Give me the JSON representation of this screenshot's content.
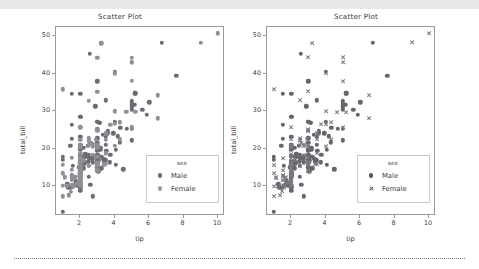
{
  "window": {
    "top_bar_color": "#e9e9e9",
    "background": "#ffffff",
    "separator_color": "#7b7b8d"
  },
  "colors": {
    "male": "#6b6b72",
    "female": "#8f8f96",
    "axis": "#9a9a9a",
    "text": "#3d3d3d",
    "legend_border": "#c9c9c9"
  },
  "panels": [
    {
      "id": "left",
      "title": "Scatter Plot",
      "xlabel": "tip",
      "ylabel": "total_bill",
      "xticks": [
        "2",
        "4",
        "6",
        "8",
        "10"
      ],
      "yticks": [
        "10",
        "20",
        "30",
        "40",
        "50"
      ],
      "legend": {
        "title": "sex",
        "entries": [
          {
            "label": "Male",
            "marker": "circle",
            "color": "#6b6b72"
          },
          {
            "label": "Female",
            "marker": "circle",
            "color": "#9a9aa1"
          }
        ]
      }
    },
    {
      "id": "right",
      "title": "Scatter Plot",
      "xlabel": "tip",
      "ylabel": "total_bill",
      "xticks": [
        "2",
        "4",
        "6",
        "8",
        "10"
      ],
      "yticks": [
        "10",
        "20",
        "30",
        "40",
        "50"
      ],
      "legend": {
        "title": "sex",
        "entries": [
          {
            "label": "Male",
            "marker": "circle",
            "color": "#55555c"
          },
          {
            "label": "Female",
            "marker": "x",
            "color": "#55555c"
          }
        ]
      }
    }
  ],
  "chart_data": {
    "type": "scatter",
    "title": "Scatter Plot",
    "xlabel": "tip",
    "ylabel": "total_bill",
    "xlim": [
      0.6,
      10.4
    ],
    "ylim": [
      2.0,
      52.5
    ],
    "xticks": [
      2,
      4,
      6,
      8,
      10
    ],
    "yticks": [
      10,
      20,
      30,
      40,
      50
    ],
    "grid": false,
    "legend_title": "sex",
    "legend_position": "lower right",
    "panels": [
      {
        "title": "Scatter Plot",
        "style": "hue-only",
        "markers": {
          "Male": "circle",
          "Female": "circle"
        }
      },
      {
        "title": "Scatter Plot",
        "style": "hue-and-style",
        "markers": {
          "Male": "circle",
          "Female": "x"
        }
      }
    ],
    "series": [
      {
        "name": "Male",
        "marker": "circle",
        "color": "#6b6b72",
        "points": [
          [
            1.01,
            16.99
          ],
          [
            1.66,
            10.34
          ],
          [
            3.5,
            21.01
          ],
          [
            3.31,
            23.68
          ],
          [
            3.61,
            24.59
          ],
          [
            4.71,
            25.29
          ],
          [
            2.0,
            8.77
          ],
          [
            3.12,
            26.88
          ],
          [
            1.96,
            15.04
          ],
          [
            3.23,
            14.78
          ],
          [
            1.71,
            10.27
          ],
          [
            1.57,
            15.42
          ],
          [
            3.0,
            21.58
          ],
          [
            3.02,
            16.29
          ],
          [
            3.92,
            24.08
          ],
          [
            1.67,
            10.33
          ],
          [
            3.71,
            16.31
          ],
          [
            3.5,
            16.93
          ],
          [
            3.35,
            17.29
          ],
          [
            4.08,
            19.65
          ],
          [
            2.75,
            17.92
          ],
          [
            2.23,
            20.29
          ],
          [
            7.58,
            39.42
          ],
          [
            3.18,
            19.82
          ],
          [
            2.34,
            17.81
          ],
          [
            2.0,
            13.37
          ],
          [
            2.0,
            12.69
          ],
          [
            4.3,
            21.7
          ],
          [
            3.0,
            19.65
          ],
          [
            1.45,
            9.55
          ],
          [
            2.5,
            18.35
          ],
          [
            3.0,
            15.06
          ],
          [
            2.45,
            20.69
          ],
          [
            3.27,
            17.78
          ],
          [
            3.6,
            24.06
          ],
          [
            2.0,
            16.31
          ],
          [
            3.07,
            16.93
          ],
          [
            2.31,
            18.69
          ],
          [
            5.0,
            31.27
          ],
          [
            2.24,
            16.04
          ],
          [
            2.54,
            17.46
          ],
          [
            3.06,
            13.94
          ],
          [
            1.32,
            9.68
          ],
          [
            5.6,
            30.4
          ],
          [
            3.0,
            18.29
          ],
          [
            5.0,
            22.23
          ],
          [
            6.0,
            32.4
          ],
          [
            2.05,
            28.55
          ],
          [
            3.0,
            18.04
          ],
          [
            2.5,
            12.54
          ],
          [
            2.6,
            10.29
          ],
          [
            5.2,
            34.81
          ],
          [
            1.56,
            9.94
          ],
          [
            4.34,
            25.56
          ],
          [
            3.51,
            19.49
          ],
          [
            3.0,
            38.01
          ],
          [
            1.5,
            26.41
          ],
          [
            1.76,
            11.24
          ],
          [
            6.73,
            48.27
          ],
          [
            3.21,
            20.29
          ],
          [
            2.0,
            13.81
          ],
          [
            1.98,
            11.02
          ],
          [
            3.76,
            18.29
          ],
          [
            2.64,
            17.59
          ],
          [
            3.15,
            20.08
          ],
          [
            2.47,
            16.45
          ],
          [
            1.0,
            3.07
          ],
          [
            2.01,
            20.23
          ],
          [
            2.09,
            15.01
          ],
          [
            1.97,
            12.02
          ],
          [
            3.0,
            17.07
          ],
          [
            3.14,
            26.86
          ],
          [
            5.0,
            25.28
          ],
          [
            2.2,
            14.73
          ],
          [
            1.25,
            10.51
          ],
          [
            3.08,
            17.92
          ],
          [
            4.0,
            27.2
          ],
          [
            3.0,
            22.76
          ],
          [
            2.71,
            17.29
          ],
          [
            3.0,
            19.44
          ],
          [
            3.4,
            16.66
          ],
          [
            1.83,
            10.07
          ],
          [
            5.0,
            32.68
          ],
          [
            2.03,
            15.98
          ],
          [
            5.17,
            34.83
          ],
          [
            5.85,
            29.03
          ],
          [
            3.0,
            27.18
          ],
          [
            1.5,
            22.67
          ],
          [
            1.0,
            17.82
          ],
          [
            2.0,
            12.46
          ],
          [
            2.74,
            16.32
          ],
          [
            2.0,
            16.0
          ],
          [
            2.0,
            10.09
          ],
          [
            5.14,
            31.71
          ],
          [
            5.0,
            31.85
          ],
          [
            2.2,
            16.82
          ],
          [
            3.48,
            32.9
          ],
          [
            2.24,
            17.89
          ],
          [
            4.5,
            14.48
          ],
          [
            2.0,
            9.6
          ],
          [
            2.0,
            34.63
          ],
          [
            1.5,
            34.65
          ],
          [
            4.19,
            23.33
          ],
          [
            2.56,
            45.35
          ],
          [
            2.02,
            23.17
          ],
          [
            4.0,
            40.55
          ],
          [
            1.44,
            20.69
          ],
          [
            2.0,
            20.9
          ],
          [
            5.0,
            30.46
          ],
          [
            2.0,
            18.15
          ],
          [
            3.48,
            23.1
          ],
          [
            4.08,
            15.69
          ],
          [
            2.0,
            19.81
          ],
          [
            2.0,
            28.44
          ],
          [
            2.5,
            15.48
          ],
          [
            3.0,
            16.58
          ],
          [
            2.72,
            7.25
          ],
          [
            2.88,
            31.27
          ],
          [
            2.0,
            13.0
          ],
          [
            3.0,
            18.04
          ]
        ]
      },
      {
        "name": "Female",
        "marker_left": "circle",
        "marker_right": "x",
        "color": "#8f8f96",
        "points": [
          [
            1.0,
            10.07
          ],
          [
            3.02,
            16.29
          ],
          [
            1.67,
            10.33
          ],
          [
            3.0,
            35.26
          ],
          [
            3.39,
            15.77
          ],
          [
            1.64,
            11.87
          ],
          [
            2.0,
            14.83
          ],
          [
            1.97,
            20.29
          ],
          [
            2.0,
            13.42
          ],
          [
            1.5,
            11.69
          ],
          [
            2.5,
            22.76
          ],
          [
            3.0,
            20.29
          ],
          [
            2.0,
            17.31
          ],
          [
            3.5,
            22.42
          ],
          [
            2.0,
            16.49
          ],
          [
            2.01,
            15.36
          ],
          [
            1.0,
            7.25
          ],
          [
            2.75,
            20.53
          ],
          [
            3.0,
            15.95
          ],
          [
            1.5,
            10.33
          ],
          [
            4.3,
            27.05
          ],
          [
            1.45,
            8.52
          ],
          [
            2.0,
            14.0
          ],
          [
            1.56,
            9.78
          ],
          [
            2.0,
            13.03
          ],
          [
            2.75,
            18.28
          ],
          [
            1.1,
            12.16
          ],
          [
            3.0,
            25.21
          ],
          [
            4.3,
            22.49
          ],
          [
            5.0,
            44.3
          ],
          [
            2.92,
            22.42
          ],
          [
            2.5,
            20.92
          ],
          [
            3.5,
            24.01
          ],
          [
            3.0,
            20.45
          ],
          [
            1.0,
            13.42
          ],
          [
            2.0,
            16.27
          ],
          [
            2.0,
            10.65
          ],
          [
            1.1,
            12.43
          ],
          [
            3.5,
            24.08
          ],
          [
            2.0,
            11.69
          ],
          [
            2.0,
            13.42
          ],
          [
            3.0,
            14.26
          ],
          [
            3.48,
            15.95
          ],
          [
            2.5,
            22.12
          ],
          [
            1.5,
            14.31
          ],
          [
            2.0,
            14.0
          ],
          [
            1.36,
            7.56
          ],
          [
            2.0,
            10.34
          ],
          [
            1.83,
            10.63
          ],
          [
            2.03,
            15.98
          ],
          [
            2.0,
            14.73
          ],
          [
            2.0,
            10.65
          ],
          [
            4.0,
            20.69
          ],
          [
            3.0,
            16.21
          ],
          [
            2.0,
            13.81
          ],
          [
            1.5,
            17.51
          ],
          [
            1.25,
            10.07
          ],
          [
            2.0,
            11.35
          ],
          [
            2.5,
            15.38
          ],
          [
            3.0,
            44.3
          ],
          [
            2.0,
            22.42
          ],
          [
            2.0,
            20.92
          ],
          [
            1.73,
            12.48
          ],
          [
            5.2,
            29.85
          ],
          [
            2.0,
            25.71
          ],
          [
            4.0,
            26.59
          ],
          [
            3.23,
            48.17
          ],
          [
            4.67,
            29.85
          ],
          [
            5.0,
            25.71
          ],
          [
            1.5,
            12.6
          ],
          [
            2.5,
            32.83
          ],
          [
            1.0,
            35.83
          ],
          [
            9.0,
            48.33
          ],
          [
            10.0,
            50.81
          ],
          [
            3.0,
            20.9
          ],
          [
            1.97,
            16.47
          ],
          [
            3.5,
            18.78
          ],
          [
            2.0,
            18.64
          ],
          [
            1.5,
            11.61
          ],
          [
            2.0,
            10.77
          ],
          [
            3.0,
            15.53
          ],
          [
            2.0,
            10.07
          ],
          [
            1.5,
            12.9
          ],
          [
            2.0,
            13.27
          ],
          [
            3.0,
            17.82
          ],
          [
            2.23,
            16.93
          ],
          [
            2.75,
            21.16
          ],
          [
            2.0,
            13.42
          ],
          [
            3.0,
            16.27
          ],
          [
            1.0,
            15.69
          ],
          [
            2.0,
            11.61
          ],
          [
            3.0,
            24.71
          ],
          [
            2.6,
            21.5
          ],
          [
            1.5,
            12.66
          ],
          [
            2.0,
            16.21
          ],
          [
            4.0,
            29.93
          ],
          [
            2.0,
            10.33
          ],
          [
            6.5,
            34.3
          ],
          [
            6.5,
            28.15
          ],
          [
            4.0,
            40.17
          ],
          [
            5.0,
            43.11
          ],
          [
            3.75,
            26.41
          ],
          [
            2.0,
            13.16
          ],
          [
            2.0,
            17.47
          ],
          [
            3.0,
            14.07
          ],
          [
            2.0,
            12.6
          ],
          [
            2.0,
            20.45
          ],
          [
            2.5,
            22.12
          ],
          [
            5.0,
            38.07
          ],
          [
            3.0,
            25.0
          ]
        ]
      }
    ]
  }
}
